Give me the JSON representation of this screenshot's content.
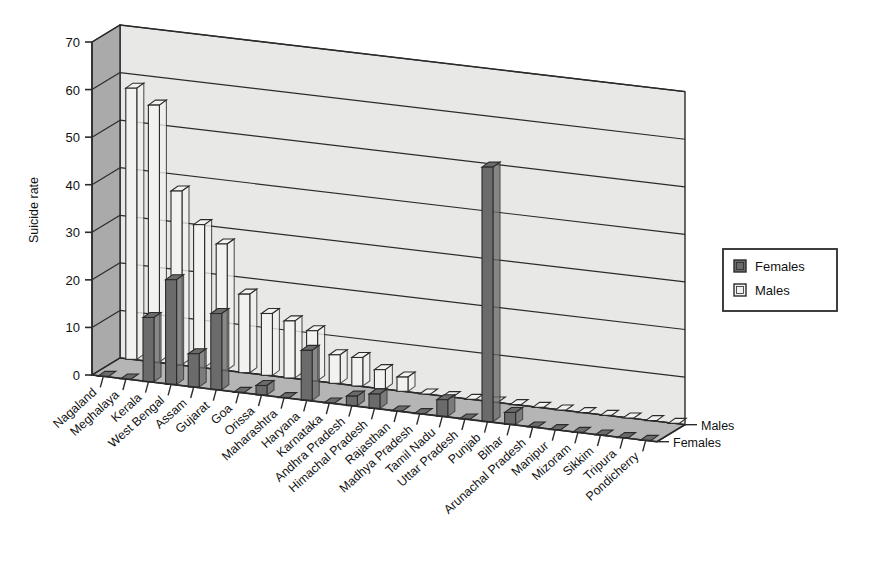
{
  "chart_data": {
    "type": "bar",
    "title": "",
    "subtitle": "",
    "xlabel": "",
    "ylabel": "Suicide rate",
    "zlabel": "",
    "ylim": [
      0,
      70
    ],
    "ytick_step": 10,
    "yticks": [
      "0",
      "10",
      "20",
      "30",
      "40",
      "50",
      "60",
      "70"
    ],
    "grid": true,
    "projection": "3d",
    "legend_position": "right",
    "legend_entries": [
      "Females",
      "Males"
    ],
    "depth_axis_labels": [
      "Males",
      "Females"
    ],
    "categories": [
      "Nagaland",
      "Meghalaya",
      "Kerala",
      "West Bengal",
      "Assam",
      "Gujarat",
      "Goa",
      "Orissa",
      "Maharashtra",
      "Haryana",
      "Karnataka",
      "Andhra Pradesh",
      "Himachal Pradesh",
      "Rajasthan",
      "Madhya Pradesh",
      "Tamil Nadu",
      "Uttar Pradesh",
      "Punjab",
      "Bihar",
      "Arunachal Pradesh",
      "Manipur",
      "Mizoram",
      "Sikkim",
      "Tripura",
      "Pondicherry"
    ],
    "series": [
      {
        "name": "Males",
        "color": "#f2f2f0",
        "values": [
          57,
          54,
          36.5,
          30,
          26.5,
          16.5,
          13,
          12,
          10.5,
          6,
          6,
          4,
          3,
          0.5,
          0,
          0,
          0,
          0,
          0,
          0,
          0,
          0,
          0,
          0,
          0
        ]
      },
      {
        "name": "Females",
        "color": "#6b6b6b",
        "values": [
          0,
          0,
          13.5,
          22,
          7,
          16,
          0,
          2,
          0,
          10.5,
          0,
          2,
          3,
          0,
          0,
          3.5,
          0,
          53.5,
          2.5,
          0,
          0,
          0,
          0,
          0,
          0
        ]
      }
    ]
  },
  "legend": {
    "items": [
      {
        "label": "Females",
        "swatch": "#6b6b6b"
      },
      {
        "label": "Males",
        "swatch": "#f2f2f0"
      }
    ]
  },
  "colors": {
    "wall_back": "#e8e8e6",
    "wall_side": "#aaaaaa",
    "floor": "#b5b5b5",
    "bar_male": "#f2f2f0",
    "bar_female": "#6b6b6b",
    "outline": "#2b2b2b",
    "grid": "#2b2b2b"
  }
}
